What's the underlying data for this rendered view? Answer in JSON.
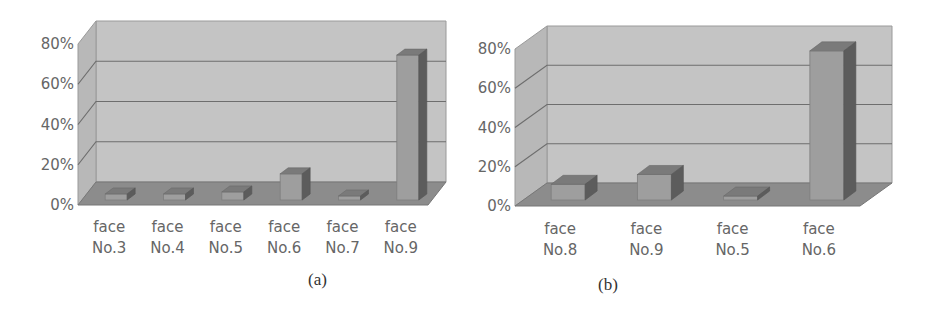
{
  "figure": {
    "panels": [
      {
        "caption": "(a)"
      },
      {
        "caption": "(b)"
      }
    ]
  },
  "colors": {
    "wall": "#c4c4c4",
    "side_wall": "#b8b8b8",
    "floor": "#8c8c8c",
    "gridline": "#6e6e6e",
    "bar_front": "#9e9e9e",
    "bar_top": "#7a7a7a",
    "bar_side": "#5c5c5c",
    "text": "#666666"
  },
  "chart_data": [
    {
      "type": "bar",
      "style": "3d-column",
      "title": "",
      "caption": "(a)",
      "xlabel": "",
      "ylabel": "",
      "categories": [
        "face No.3",
        "face No.4",
        "face No.5",
        "face No.6",
        "face No.7",
        "face No.9"
      ],
      "category_lines": [
        [
          "face",
          "No.3"
        ],
        [
          "face",
          "No.4"
        ],
        [
          "face",
          "No.5"
        ],
        [
          "face",
          "No.6"
        ],
        [
          "face",
          "No.7"
        ],
        [
          "face",
          "No.9"
        ]
      ],
      "values": [
        3,
        3,
        4,
        13,
        2,
        72
      ],
      "yticks": [
        "0%",
        "20%",
        "40%",
        "60%",
        "80%"
      ],
      "ylim": [
        0,
        80
      ],
      "grid": true,
      "legend": null
    },
    {
      "type": "bar",
      "style": "3d-column",
      "title": "",
      "caption": "(b)",
      "xlabel": "",
      "ylabel": "",
      "categories": [
        "face No.8",
        "face No.9",
        "face No.5",
        "face No.6"
      ],
      "category_lines": [
        [
          "face",
          "No.8"
        ],
        [
          "face",
          "No.9"
        ],
        [
          "face",
          "No.5"
        ],
        [
          "face",
          "No.6"
        ]
      ],
      "values": [
        8,
        13,
        2,
        76
      ],
      "yticks": [
        "0%",
        "20%",
        "40%",
        "60%",
        "80%"
      ],
      "ylim": [
        0,
        80
      ],
      "grid": true,
      "legend": null
    }
  ]
}
